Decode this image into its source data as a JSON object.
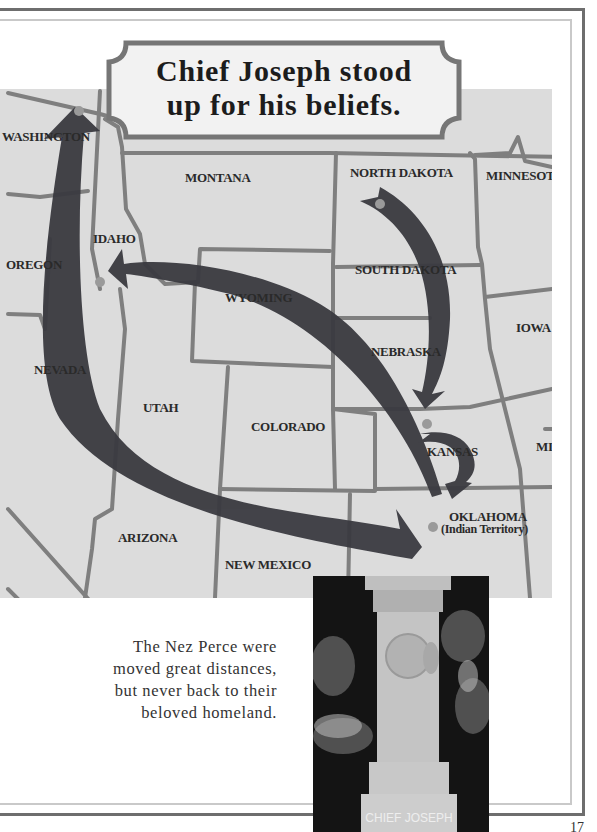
{
  "title": {
    "line1": "Chief Joseph stood",
    "line2": "up for his beliefs."
  },
  "map": {
    "background_color": "#dcdcdc",
    "border_color": "#7a7a7a",
    "arrow_color": "#3a3a40",
    "dot_color": "#9a9a9a",
    "states": {
      "washington": "WASHINGTON",
      "montana": "MONTANA",
      "north_dakota": "NORTH DAKOTA",
      "minnesota": "MINNESOTA",
      "idaho": "IDAHO",
      "oregon": "OREGON",
      "south_dakota": "SOUTH DAKOTA",
      "wyoming": "WYOMING",
      "iowa": "IOWA",
      "nevada": "NEVADA",
      "nebraska": "NEBRASKA",
      "utah": "UTAH",
      "colorado": "COLORADO",
      "kansas": "KANSAS",
      "missouri": "MI",
      "oklahoma": "OKLAHOMA",
      "oklahoma_sub": "(Indian Territory)",
      "arizona": "ARIZONA",
      "new_mexico": "NEW MEXICO"
    },
    "routes": [
      {
        "from": "Idaho",
        "to": "North Dakota (Montana border)",
        "note": "arrow via Kansas to Oklahoma"
      },
      {
        "from": "North Dakota",
        "to": "Kansas"
      },
      {
        "from": "Kansas",
        "to": "Oklahoma (Indian Territory)"
      },
      {
        "from": "Oklahoma (Indian Territory)",
        "to": "Idaho"
      },
      {
        "from": "Oklahoma (Indian Territory)",
        "to": "Washington"
      }
    ]
  },
  "caption": {
    "line1": "The Nez Perce were",
    "line2": "moved great distances,",
    "line3": "but never back to their",
    "line4": "beloved homeland."
  },
  "photo": {
    "subject": "Chief Joseph grave monument",
    "inscription": "CHIEF JOSEPH"
  },
  "page_number": "17"
}
